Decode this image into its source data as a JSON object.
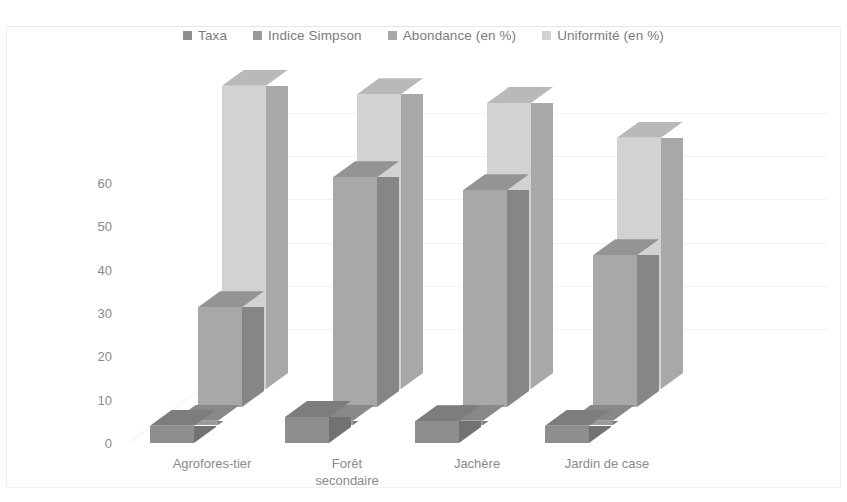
{
  "chart_data": {
    "type": "bar",
    "title": "",
    "subtitle": "",
    "xlabel": "",
    "ylabel": "",
    "categories": [
      "Agrofores-tier",
      "Forêt\nsecondaire",
      "Jachère",
      "Jardin de case"
    ],
    "series": [
      {
        "name": "Taxa",
        "values": [
          4,
          6,
          5,
          4
        ],
        "color": "#8e8e8e"
      },
      {
        "name": "Indice Simpson",
        "values": [
          1,
          1,
          1,
          1
        ],
        "color": "#9a9a9a"
      },
      {
        "name": "Abondance (en %)",
        "values": [
          23,
          53,
          50,
          35
        ],
        "color": "#a8a8a8"
      },
      {
        "name": "Uniformité (en %)",
        "values": [
          70,
          68,
          66,
          58
        ],
        "color": "#d2d2d2"
      }
    ],
    "ylim": [
      0,
      70
    ],
    "yticks": [
      0,
      10,
      20,
      30,
      40,
      50,
      60
    ],
    "ytick_labels": [
      "0",
      "10",
      "20",
      "30",
      "40",
      "50",
      "60"
    ],
    "grid": true,
    "legend_position": "top",
    "three_d": true
  },
  "legend": {
    "items": [
      {
        "label": "Taxa",
        "color": "#8e8e8e"
      },
      {
        "label": "Indice Simpson",
        "color": "#9a9a9a"
      },
      {
        "label": "Abondance (en %)",
        "color": "#a8a8a8"
      },
      {
        "label": "Uniformité (en %)",
        "color": "#d2d2d2"
      }
    ]
  },
  "axes": {
    "y_tick_labels": [
      "60",
      "50",
      "40",
      "30",
      "20",
      "10",
      "0"
    ],
    "x_category_labels": [
      "Agrofores-tier",
      "Forêt\nsecondaire",
      "Jachère",
      "Jardin de case"
    ]
  },
  "colors": {
    "background": "#ffffff",
    "grid": "#f2f2f2",
    "text": "#8a8a8a",
    "series_1": "#8e8e8e",
    "series_2": "#9a9a9a",
    "series_3": "#a8a8a8",
    "series_4": "#d2d2d2"
  }
}
